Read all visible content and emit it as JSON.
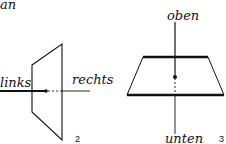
{
  "top_left_fragment": "an",
  "figure2": {
    "number": "2",
    "label_left": "links",
    "label_right": "rechts"
  },
  "figure3": {
    "number": "3",
    "label_top": "oben",
    "label_bottom": "unten"
  },
  "colors": {
    "ink": "#111111",
    "background": "#ffffff"
  }
}
